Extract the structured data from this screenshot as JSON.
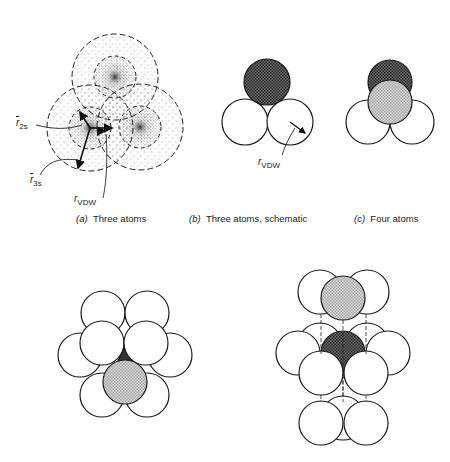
{
  "panels": {
    "a": {
      "letter": "(a)",
      "title": "Three atoms",
      "labels": {
        "r2s_sym": "r",
        "r2s_sub": "2s",
        "r3s_sym": "r",
        "r3s_sub": "3s",
        "rvdw_sym": "r",
        "rvdw_sub": "VDW"
      }
    },
    "b": {
      "letter": "(b)",
      "title": "Three atoms, schematic",
      "labels": {
        "rvdw_sym": "r",
        "rvdw_sub": "VDW"
      }
    },
    "c": {
      "letter": "(c)",
      "title": "Four atoms"
    },
    "d": {
      "title": ""
    },
    "e": {
      "title": ""
    }
  },
  "colors": {
    "outline": "#1a1a1a",
    "dark_atom": "#555555",
    "light_atom": "#c8c8c8",
    "empty_atom": "#ffffff",
    "electron_dots": "#333333"
  }
}
